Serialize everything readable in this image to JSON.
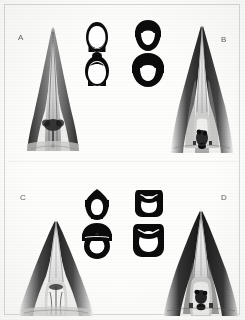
{
  "plate": {
    "background_color": "#fdfdfc",
    "ink_color": "#121212",
    "label_color": "#5a5a58",
    "border_color": "#d8d8d4",
    "caption": "",
    "width": 245,
    "height": 320
  },
  "panels": [
    {
      "id": "A",
      "label": "A",
      "position": "top-left",
      "subject": "bird bill ventral palate view",
      "description": "narrow sharply pointed bill, slender tapering rami, dark lateral shading",
      "label_x": 18,
      "label_y": 34
    },
    {
      "id": "B",
      "label": "B",
      "position": "top-right",
      "subject": "bird bill ventral palate view",
      "description": "broad triangular bill, wide gape, heavy dark lateral margins, textured tongue region",
      "label_x": 221,
      "label_y": 36
    },
    {
      "id": "C",
      "label": "C",
      "position": "bottom-left",
      "subject": "bird bill ventral palate view",
      "description": "moderately broad bill, rounded tip, paired palatal ridges",
      "label_x": 20,
      "label_y": 194
    },
    {
      "id": "D",
      "label": "D",
      "position": "bottom-right",
      "subject": "bird bill ventral palate view",
      "description": "broad bill with rounded tip, strongly dark lateral rami, dark median structure",
      "label_x": 221,
      "label_y": 194
    }
  ],
  "sections": [
    {
      "id": "A1",
      "belongs_to": "A",
      "column": "left",
      "row": "top-upper",
      "shape": "oval-ring-open-bottom",
      "outline": "solid black oval ring",
      "lumen": "white oval, open at base",
      "cx": 97,
      "cy": 36
    },
    {
      "id": "A2",
      "belongs_to": "A",
      "column": "left",
      "row": "top-lower",
      "shape": "oval-ring-open-bottom",
      "outline": "solid black oval ring with small apical knob",
      "lumen": "white oval, open at base",
      "cx": 97,
      "cy": 69
    },
    {
      "id": "B1",
      "belongs_to": "B",
      "column": "right",
      "row": "top-upper",
      "shape": "capped-c-ring",
      "outline": "solid black dome cap over C-shaped ring",
      "lumen": "white crescent opening downward",
      "cx": 147,
      "cy": 34
    },
    {
      "id": "B2",
      "belongs_to": "B",
      "column": "right",
      "row": "top-lower",
      "shape": "capped-c-ring",
      "outline": "solid black mushroom cap over wide C-shaped ring",
      "lumen": "white crescent opening downward",
      "cx": 147,
      "cy": 69
    },
    {
      "id": "C1",
      "belongs_to": "C",
      "column": "left",
      "row": "bottom-upper",
      "shape": "pointed-cap-ring",
      "outline": "black pointed dome over ring",
      "lumen": "white rounded lumen",
      "cx": 96,
      "cy": 205
    },
    {
      "id": "C2",
      "belongs_to": "C",
      "column": "left",
      "row": "bottom-lower",
      "shape": "dome-cap-ring",
      "outline": "black dome cap over thick ring",
      "lumen": "white circular lumen",
      "cx": 96,
      "cy": 240
    },
    {
      "id": "D1",
      "belongs_to": "D",
      "column": "right",
      "row": "bottom-upper",
      "shape": "squared-ring-notched",
      "outline": "black squared ring with notched top edge",
      "lumen": "white lumen with thin white apical slit",
      "cx": 148,
      "cy": 202
    },
    {
      "id": "D2",
      "belongs_to": "D",
      "column": "right",
      "row": "bottom-lower",
      "shape": "squared-ring-notched",
      "outline": "black squared ring with notched top edge",
      "lumen": "white broad lumen with thin white apical slit",
      "cx": 148,
      "cy": 240
    }
  ]
}
